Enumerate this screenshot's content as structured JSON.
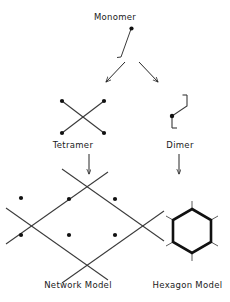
{
  "figure": {
    "width": 230,
    "height": 302,
    "background_color": "#ffffff",
    "ink_color": "#262626",
    "node_color": "#111111"
  },
  "labels": {
    "monomer": "Monomer",
    "tetramer": "Tetramer",
    "dimer": "Dimer",
    "network_model": "Network Model",
    "hexagon_model": "Hexagon Model"
  },
  "diagram_data": {
    "type": "schematic-flow",
    "description": "Self-assembly scheme: a monomer unit branches into a tetramer (four-armed cross) and a dimer (two-armed bent unit); the tetramer builds a square network model and the dimer builds a hexagon model.",
    "nodes": [
      {
        "id": "monomer",
        "label": "Monomer",
        "shape": "dot-with-single-arm",
        "arms": 1,
        "dots": 1
      },
      {
        "id": "tetramer",
        "label": "Tetramer",
        "shape": "four-armed-cross",
        "arms": 4,
        "dots": 4
      },
      {
        "id": "dimer",
        "label": "Dimer",
        "shape": "two-armed-bent-z",
        "arms": 2,
        "dots": 1
      },
      {
        "id": "network_model",
        "label": "Network Model",
        "shape": "diamond-lattice-of-crosses",
        "crossings": 4
      },
      {
        "id": "hexagon_model",
        "label": "Hexagon Model",
        "shape": "hexagon-with-six-stubs",
        "vertices": 6,
        "stubs": 6
      }
    ],
    "edges": [
      {
        "from": "monomer",
        "to": "tetramer",
        "style": "diagonal-arrow"
      },
      {
        "from": "monomer",
        "to": "dimer",
        "style": "diagonal-arrow"
      },
      {
        "from": "tetramer",
        "to": "network_model",
        "style": "vertical-arrow"
      },
      {
        "from": "dimer",
        "to": "hexagon_model",
        "style": "vertical-arrow"
      }
    ]
  }
}
